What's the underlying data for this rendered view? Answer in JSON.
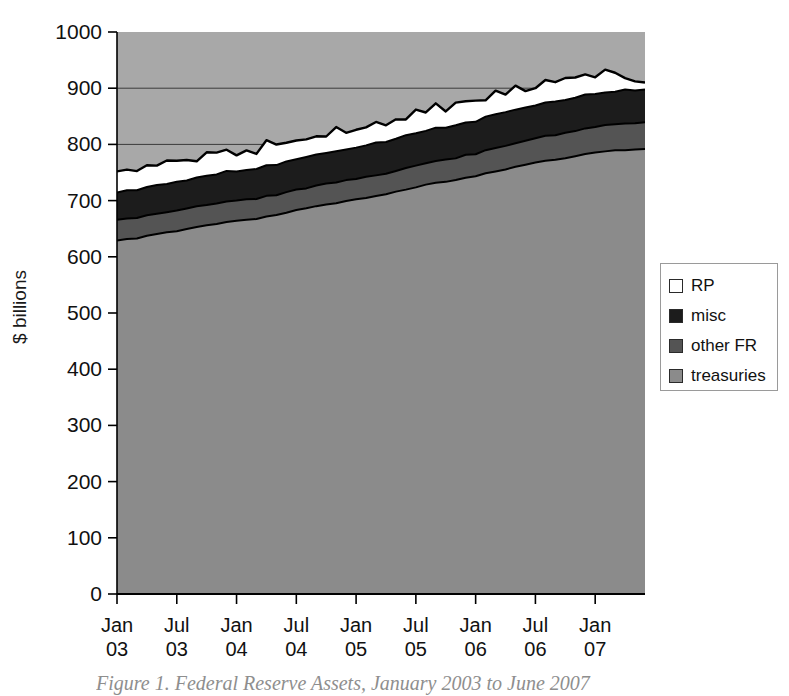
{
  "figure": {
    "caption": "Figure 1.  Federal Reserve Assets, January 2003 to June 2007"
  },
  "axes": {
    "y_title": "$ billions",
    "y_ticks": [
      "0",
      "100",
      "200",
      "300",
      "400",
      "500",
      "600",
      "700",
      "800",
      "900",
      "1000"
    ],
    "x_ticks": [
      {
        "month": "Jan",
        "year": "03"
      },
      {
        "month": "Jul",
        "year": "03"
      },
      {
        "month": "Jan",
        "year": "04"
      },
      {
        "month": "Jul",
        "year": "04"
      },
      {
        "month": "Jan",
        "year": "05"
      },
      {
        "month": "Jul",
        "year": "05"
      },
      {
        "month": "Jan",
        "year": "06"
      },
      {
        "month": "Jul",
        "year": "06"
      },
      {
        "month": "Jan",
        "year": "07"
      }
    ]
  },
  "legend": {
    "items": [
      {
        "label": "RP",
        "color": "#ffffff"
      },
      {
        "label": "misc",
        "color": "#1c1c1c"
      },
      {
        "label": "other FR",
        "color": "#545454"
      },
      {
        "label": "treasuries",
        "color": "#8b8b8b"
      }
    ]
  },
  "colors": {
    "treasuries": "#8b8b8b",
    "other_fr": "#545454",
    "misc": "#1c1c1c",
    "rp": "#ffffff",
    "outline": "#000000",
    "gridline": "#3a3a3a",
    "axis": "#000000",
    "text": "#111111",
    "caption": "#8e8e8e"
  },
  "chart_data": {
    "type": "area",
    "title": "Federal Reserve Assets, January 2003 to June 2007",
    "subtitle": "",
    "xlabel": "",
    "ylabel": "$ billions",
    "ylim": [
      0,
      1000
    ],
    "ytick_step": 100,
    "grid": "horizontal gridlines at 800 and 900 only",
    "legend_position": "right, outside plot",
    "stacked": true,
    "stack_order_bottom_to_top": [
      "treasuries",
      "other FR",
      "misc",
      "RP"
    ],
    "x": [
      "2003-01",
      "2003-02",
      "2003-03",
      "2003-04",
      "2003-05",
      "2003-06",
      "2003-07",
      "2003-08",
      "2003-09",
      "2003-10",
      "2003-11",
      "2003-12",
      "2004-01",
      "2004-02",
      "2004-03",
      "2004-04",
      "2004-05",
      "2004-06",
      "2004-07",
      "2004-08",
      "2004-09",
      "2004-10",
      "2004-11",
      "2004-12",
      "2005-01",
      "2005-02",
      "2005-03",
      "2005-04",
      "2005-05",
      "2005-06",
      "2005-07",
      "2005-08",
      "2005-09",
      "2005-10",
      "2005-11",
      "2005-12",
      "2006-01",
      "2006-02",
      "2006-03",
      "2006-04",
      "2006-05",
      "2006-06",
      "2006-07",
      "2006-08",
      "2006-09",
      "2006-10",
      "2006-11",
      "2006-12",
      "2007-01",
      "2007-02",
      "2007-03",
      "2007-04",
      "2007-05",
      "2007-06"
    ],
    "series": [
      {
        "name": "treasuries",
        "color": "#8b8b8b",
        "values": [
          629,
          631,
          633,
          637,
          640,
          643,
          646,
          650,
          653,
          656,
          659,
          662,
          664,
          666,
          668,
          671,
          675,
          679,
          683,
          687,
          690,
          693,
          696,
          699,
          702,
          705,
          708,
          712,
          716,
          720,
          724,
          728,
          731,
          734,
          737,
          740,
          744,
          748,
          752,
          756,
          760,
          764,
          767,
          770,
          773,
          776,
          779,
          782,
          785,
          787,
          789,
          790,
          791,
          792
        ]
      },
      {
        "name": "other FR",
        "color": "#545454",
        "values": [
          37,
          37,
          36,
          36,
          36,
          36,
          36,
          36,
          36,
          36,
          36,
          36,
          36,
          36,
          36,
          36,
          36,
          36,
          36,
          36,
          36,
          37,
          37,
          37,
          37,
          37,
          37,
          37,
          37,
          38,
          38,
          38,
          38,
          39,
          39,
          40,
          40,
          41,
          41,
          42,
          42,
          43,
          43,
          44,
          44,
          45,
          45,
          46,
          46,
          46,
          47,
          47,
          47,
          48
        ]
      },
      {
        "name": "misc",
        "color": "#1c1c1c",
        "values": [
          48,
          49,
          49,
          50,
          50,
          51,
          51,
          51,
          52,
          52,
          52,
          53,
          53,
          53,
          53,
          54,
          54,
          54,
          55,
          55,
          55,
          55,
          56,
          56,
          56,
          56,
          57,
          57,
          57,
          57,
          58,
          58,
          58,
          58,
          59,
          59,
          59,
          59,
          59,
          59,
          59,
          59,
          59,
          59,
          59,
          59,
          59,
          59,
          59,
          59,
          59,
          59,
          59,
          59
        ]
      },
      {
        "name": "RP",
        "color": "#ffffff",
        "values": [
          33,
          37,
          30,
          38,
          35,
          41,
          33,
          38,
          31,
          41,
          34,
          37,
          30,
          36,
          32,
          40,
          37,
          30,
          36,
          31,
          37,
          33,
          39,
          31,
          36,
          31,
          38,
          34,
          40,
          32,
          37,
          31,
          38,
          33,
          40,
          34,
          38,
          31,
          37,
          33,
          39,
          34,
          30,
          36,
          31,
          38,
          33,
          39,
          30,
          36,
          31,
          24,
          19,
          16
        ]
      }
    ]
  }
}
